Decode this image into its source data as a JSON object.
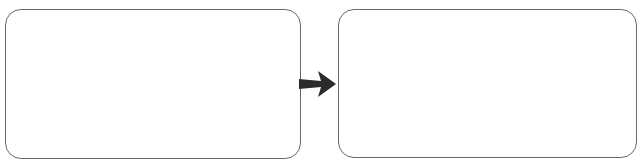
{
  "diagram": {
    "type": "flow",
    "nodes": [
      {
        "id": "left",
        "label": ""
      },
      {
        "id": "right",
        "label": ""
      }
    ],
    "edges": [
      {
        "from": "left",
        "to": "right",
        "style": "bold-arrow"
      }
    ],
    "colors": {
      "border": "#6a6a6a",
      "arrow": "#2b2b2b",
      "background": "#ffffff"
    }
  }
}
